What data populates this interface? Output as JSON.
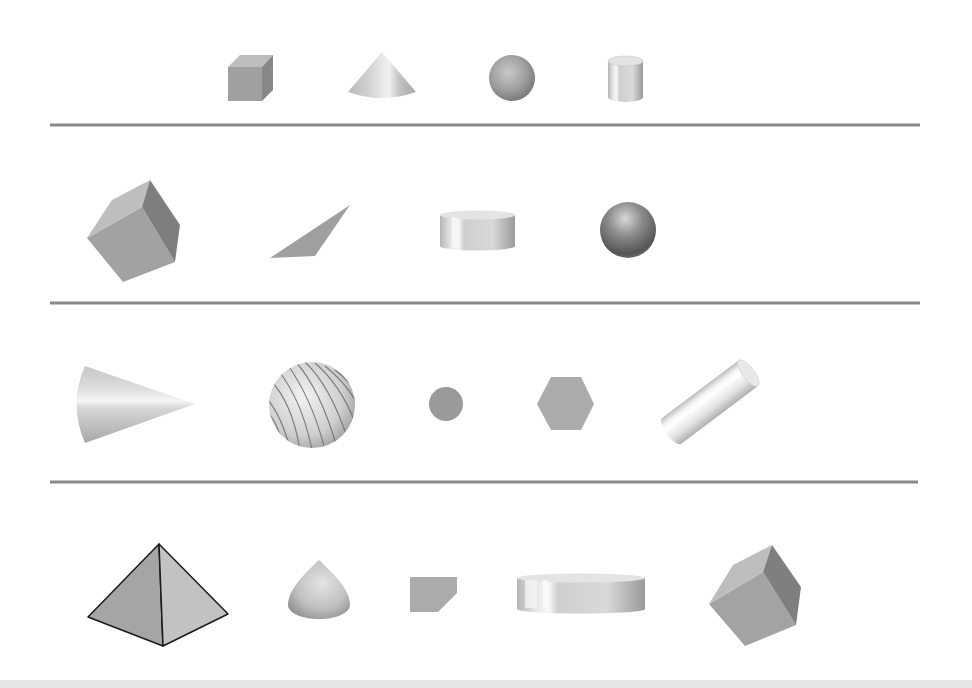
{
  "title": "3D Geometric Shapes Worksheet",
  "colors": {
    "background": "#ffffff",
    "divider": "#8a8a8a",
    "shape_gray": "#a3a3a3",
    "shape_dark": "#7c7c7c",
    "shape_light": "#d8d8d8",
    "outline": "#1a1a1a",
    "bottom_band": "#e6e6e6"
  },
  "rows": [
    {
      "name": "row-1",
      "shapes": [
        {
          "type": "cube",
          "label": "Cube"
        },
        {
          "type": "cone",
          "label": "Cone"
        },
        {
          "type": "sphere",
          "label": "Sphere"
        },
        {
          "type": "cylinder",
          "label": "Cylinder"
        }
      ]
    },
    {
      "name": "row-2",
      "shapes": [
        {
          "type": "cube",
          "label": "Rotated cube"
        },
        {
          "type": "triangle",
          "label": "Flat triangle"
        },
        {
          "type": "cylinder",
          "label": "Short cylinder"
        },
        {
          "type": "sphere",
          "label": "Shaded sphere"
        }
      ]
    },
    {
      "name": "row-3",
      "shapes": [
        {
          "type": "cone",
          "label": "Sideways cone"
        },
        {
          "type": "sphere",
          "label": "Textured sphere"
        },
        {
          "type": "circle",
          "label": "Flat circle"
        },
        {
          "type": "hexagon",
          "label": "Hexagon"
        },
        {
          "type": "cylinder",
          "label": "Tilted cylinder"
        }
      ]
    },
    {
      "name": "row-4",
      "shapes": [
        {
          "type": "pyramid",
          "label": "Square pyramid"
        },
        {
          "type": "cone",
          "label": "Cone from above"
        },
        {
          "type": "pentagon",
          "label": "Flat pentagon"
        },
        {
          "type": "cylinder",
          "label": "Wide cylinder"
        },
        {
          "type": "cube",
          "label": "Rotated cube"
        }
      ]
    }
  ],
  "dividers": 3
}
